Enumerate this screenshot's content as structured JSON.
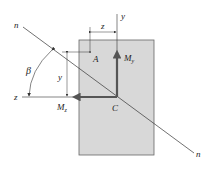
{
  "diagram": {
    "labels": {
      "n_top": "n",
      "n_bottom": "n",
      "z_dim": "z",
      "y_axis": "y",
      "point_a": "A",
      "moment_y": "M",
      "moment_y_sub": "y",
      "beta": "β",
      "y_dim": "y",
      "z_axis": "z",
      "moment_z": "M",
      "moment_z_sub": "z",
      "centroid": "C"
    },
    "colors": {
      "section_fill": "#d8d8d8",
      "section_stroke": "#555555",
      "arrow": "#555555",
      "line": "#333333"
    }
  }
}
